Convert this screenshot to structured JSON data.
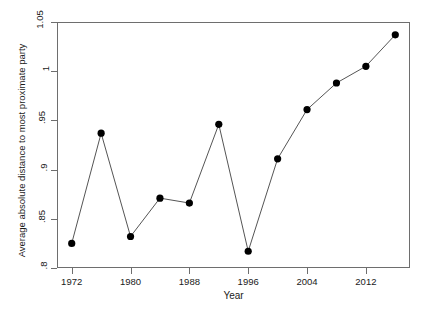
{
  "chart_data": {
    "type": "line",
    "title": "",
    "xlabel": "Year",
    "ylabel": "Average absolute distance to most proximate party",
    "xlim": [
      1970,
      2018
    ],
    "ylim": [
      0.8,
      1.05
    ],
    "grid": false,
    "legend": "none",
    "marker": "filled-circle",
    "line_color": "#555555",
    "marker_color": "#000000",
    "x": [
      1972,
      1976,
      1980,
      1984,
      1988,
      1992,
      1996,
      2000,
      2004,
      2008,
      2012,
      2016
    ],
    "values": [
      0.825,
      0.937,
      0.832,
      0.871,
      0.866,
      0.946,
      0.817,
      0.911,
      0.961,
      0.988,
      1.005,
      1.037
    ],
    "xticks": [
      1972,
      1980,
      1988,
      1996,
      2004,
      2012
    ],
    "xticklabels": [
      "1972",
      "1980",
      "1988",
      "1996",
      "2004",
      "2012"
    ],
    "yticks": [
      0.8,
      0.85,
      0.9,
      0.95,
      1.0,
      1.05
    ],
    "yticklabels": [
      ".8",
      ".85",
      ".9",
      ".95",
      "1",
      "1.05"
    ]
  }
}
